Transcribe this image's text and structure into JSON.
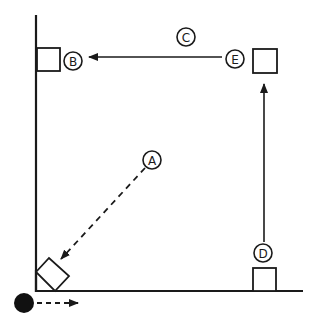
{
  "diagram": {
    "title": "",
    "colors": {
      "stroke": "#1a1a1a",
      "background": "#ffffff",
      "ball": "#111111"
    },
    "labels": {
      "A": "A",
      "B": "B",
      "C": "C",
      "D": "D",
      "E": "E"
    },
    "elements": [
      {
        "id": "A",
        "type": "circle-label",
        "desc": "Starting point of dashed diagonal path toward bottom-left corner"
      },
      {
        "id": "B",
        "type": "circle-label",
        "desc": "Position next to square on left wall"
      },
      {
        "id": "C",
        "type": "circle-label",
        "desc": "Label above horizontal arrow from E to B"
      },
      {
        "id": "D",
        "type": "circle-label",
        "desc": "Position above square at bottom right; vertical arrow up toward E"
      },
      {
        "id": "E",
        "type": "circle-label",
        "desc": "Position next to square at top right"
      }
    ],
    "arrows": [
      {
        "from": "A",
        "to": "bottom-left-square",
        "style": "dashed"
      },
      {
        "from": "E",
        "to": "B",
        "style": "solid"
      },
      {
        "from": "D",
        "to": "top-right-square",
        "style": "solid"
      },
      {
        "from": "ball",
        "to": "right",
        "style": "dashed"
      }
    ]
  }
}
